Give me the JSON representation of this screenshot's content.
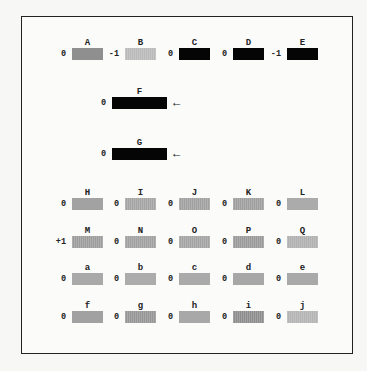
{
  "rows": [
    {
      "items": [
        {
          "label": "A",
          "value": "0",
          "color": "#8f8f8f",
          "x": 72,
          "y": 48,
          "w": 31,
          "striped": false
        },
        {
          "label": "B",
          "value": "-1",
          "color": "#b9b9b9",
          "x": 125,
          "y": 48,
          "w": 31,
          "striped": true
        },
        {
          "label": "C",
          "value": "0",
          "color": "#050505",
          "x": 179,
          "y": 48,
          "w": 31,
          "striped": false
        },
        {
          "label": "D",
          "value": "0",
          "color": "#050505",
          "x": 233,
          "y": 48,
          "w": 31,
          "striped": false
        },
        {
          "label": "E",
          "value": "-1",
          "color": "#050505",
          "x": 287,
          "y": 48,
          "w": 31,
          "striped": false
        }
      ]
    },
    {
      "items": [
        {
          "label": "F",
          "value": "0",
          "color": "#050505",
          "x": 112,
          "y": 97,
          "w": 55,
          "striped": false,
          "arrow": "←"
        }
      ]
    },
    {
      "items": [
        {
          "label": "G",
          "value": "0",
          "color": "#050505",
          "x": 112,
          "y": 148,
          "w": 55,
          "striped": false,
          "arrow": "←"
        }
      ]
    },
    {
      "items": [
        {
          "label": "H",
          "value": "0",
          "color": "#a2a2a2",
          "x": 72,
          "y": 198,
          "w": 31,
          "striped": false
        },
        {
          "label": "I",
          "value": "0",
          "color": "#a4a4a4",
          "x": 125,
          "y": 198,
          "w": 31,
          "striped": true
        },
        {
          "label": "J",
          "value": "0",
          "color": "#a0a0a0",
          "x": 179,
          "y": 198,
          "w": 31,
          "striped": true
        },
        {
          "label": "K",
          "value": "0",
          "color": "#9e9e9e",
          "x": 233,
          "y": 198,
          "w": 31,
          "striped": true
        },
        {
          "label": "L",
          "value": "0",
          "color": "#ababab",
          "x": 287,
          "y": 198,
          "w": 31,
          "striped": false
        }
      ]
    },
    {
      "items": [
        {
          "label": "M",
          "value": "+1",
          "color": "#9c9c9c",
          "x": 72,
          "y": 236,
          "w": 31,
          "striped": true
        },
        {
          "label": "N",
          "value": "0",
          "color": "#a0a0a0",
          "x": 125,
          "y": 236,
          "w": 31,
          "striped": true
        },
        {
          "label": "O",
          "value": "0",
          "color": "#a3a3a3",
          "x": 179,
          "y": 236,
          "w": 31,
          "striped": true
        },
        {
          "label": "P",
          "value": "0",
          "color": "#9a9a9a",
          "x": 233,
          "y": 236,
          "w": 31,
          "striped": true
        },
        {
          "label": "Q",
          "value": "0",
          "color": "#b0b0b0",
          "x": 287,
          "y": 236,
          "w": 31,
          "striped": true
        }
      ]
    },
    {
      "items": [
        {
          "label": "a",
          "value": "0",
          "color": "#a9a9a9",
          "x": 72,
          "y": 273,
          "w": 31,
          "striped": false
        },
        {
          "label": "b",
          "value": "0",
          "color": "#acacac",
          "x": 125,
          "y": 273,
          "w": 31,
          "striped": false
        },
        {
          "label": "c",
          "value": "0",
          "color": "#aaaaaa",
          "x": 179,
          "y": 273,
          "w": 31,
          "striped": false
        },
        {
          "label": "d",
          "value": "0",
          "color": "#a7a7a7",
          "x": 233,
          "y": 273,
          "w": 31,
          "striped": false
        },
        {
          "label": "e",
          "value": "0",
          "color": "#a9a9a9",
          "x": 287,
          "y": 273,
          "w": 31,
          "striped": false
        }
      ]
    },
    {
      "items": [
        {
          "label": "f",
          "value": "0",
          "color": "#a1a1a1",
          "x": 72,
          "y": 311,
          "w": 31,
          "striped": false
        },
        {
          "label": "g",
          "value": "0",
          "color": "#969696",
          "x": 125,
          "y": 311,
          "w": 31,
          "striped": true
        },
        {
          "label": "h",
          "value": "0",
          "color": "#a8a8a8",
          "x": 179,
          "y": 311,
          "w": 31,
          "striped": false
        },
        {
          "label": "i",
          "value": "0",
          "color": "#8d8d8d",
          "x": 233,
          "y": 311,
          "w": 31,
          "striped": true
        },
        {
          "label": "j",
          "value": "0",
          "color": "#b3b3b3",
          "x": 287,
          "y": 311,
          "w": 31,
          "striped": true
        }
      ]
    }
  ]
}
